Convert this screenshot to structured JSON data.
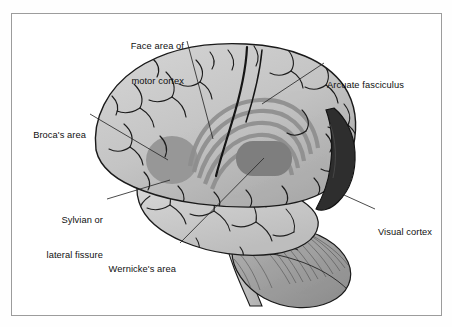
{
  "figure": {
    "type": "anatomical-diagram",
    "view": "left lateral",
    "style": "grayscale line illustration"
  },
  "frame": {
    "border_color": "#9c9c9c",
    "background": "#ffffff"
  },
  "palette": {
    "cortex_light": "#c9c9c9",
    "cortex_mid": "#b4b4b4",
    "cortex_shadow": "#a0a0a0",
    "temporal_lobe": "#cfcfcf",
    "brocas_area": "#8e8e8e",
    "wernickes_area": "#7a7a7a",
    "arcuate_arc": "#8a8a8a",
    "visual_cortex": "#2b2b2b",
    "cerebellum": "#9a9a9a",
    "brainstem": "#c4c4c4",
    "outline": "#1a1a1a",
    "leader_line": "#2a2a2a",
    "text": "#101010"
  },
  "labels": [
    {
      "id": "face-area-of-motor-cortex",
      "line1": "Face area of",
      "line2": "motor cortex",
      "align": "right",
      "x": 74,
      "y": 18,
      "width": 110,
      "leader": {
        "x1": 187,
        "y1": 41,
        "x2": 213,
        "y2": 139
      }
    },
    {
      "id": "arcuate-fasciculus",
      "line1": "Arcuate fasciculus",
      "line2": "",
      "align": "left",
      "x": 327,
      "y": 57,
      "width": 120,
      "leader": {
        "x1": 324,
        "y1": 63,
        "x2": 262,
        "y2": 104
      }
    },
    {
      "id": "brocas-area",
      "line1": "Broca's area",
      "line2": "",
      "align": "right",
      "x": 10,
      "y": 107,
      "width": 76,
      "leader": {
        "x1": 90,
        "y1": 114,
        "x2": 168,
        "y2": 160
      }
    },
    {
      "id": "sylvian-or-lateral-fissure",
      "line1": "Sylvian or",
      "line2": "lateral fissure",
      "align": "right",
      "x": 18,
      "y": 192,
      "width": 85,
      "leader": {
        "x1": 107,
        "y1": 199,
        "x2": 170,
        "y2": 180
      }
    },
    {
      "id": "visual-cortex",
      "line1": "Visual cortex",
      "line2": "",
      "align": "left",
      "x": 378,
      "y": 204,
      "width": 70,
      "leader": {
        "x1": 375,
        "y1": 209,
        "x2": 344,
        "y2": 195
      }
    },
    {
      "id": "wernickes-area",
      "line1": "Wernicke's area",
      "line2": "",
      "align": "right",
      "x": 80,
      "y": 241,
      "width": 96,
      "leader": {
        "x1": 180,
        "y1": 243,
        "x2": 264,
        "y2": 158
      }
    }
  ],
  "structures": [
    {
      "id": "cerebral-cortex",
      "name": "cerebral cortex"
    },
    {
      "id": "brocas-area",
      "name": "Broca's area"
    },
    {
      "id": "wernickes-area",
      "name": "Wernicke's area"
    },
    {
      "id": "arcuate-fasciculus",
      "name": "arcuate fasciculus"
    },
    {
      "id": "visual-cortex",
      "name": "visual cortex"
    },
    {
      "id": "temporal-lobe",
      "name": "temporal lobe"
    },
    {
      "id": "cerebellum",
      "name": "cerebellum"
    },
    {
      "id": "brainstem",
      "name": "brainstem"
    }
  ]
}
